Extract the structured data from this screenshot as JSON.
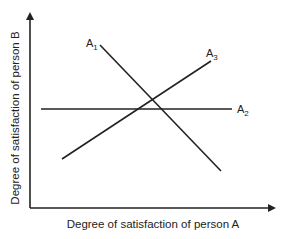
{
  "diagram": {
    "type": "line-diagram",
    "x_axis_label": "Degree of satisfaction of person A",
    "y_axis_label": "Degree of satisfaction of person B",
    "colors": {
      "line": "#222222",
      "background": "#ffffff"
    },
    "lines": [
      {
        "id": "A1",
        "label": "A",
        "subscript": "1",
        "slope": "negative"
      },
      {
        "id": "A2",
        "label": "A",
        "subscript": "2",
        "slope": "horizontal"
      },
      {
        "id": "A3",
        "label": "A",
        "subscript": "3",
        "slope": "positive"
      }
    ]
  }
}
